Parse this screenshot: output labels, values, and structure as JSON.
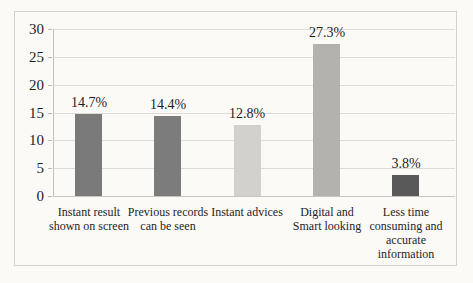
{
  "chart_data": {
    "type": "bar",
    "title": "",
    "xlabel": "",
    "ylabel": "",
    "categories": [
      "Instant result shown on screen",
      "Previous records can be seen",
      "Instant advices",
      "Digital and Smart looking",
      "Less time consuming and accurate information"
    ],
    "category_display": [
      "Instant result\nshown on screen",
      "Previous records\ncan be seen",
      "Instant advices",
      "Digital and\nSmart looking",
      "Less time\nconsuming and\naccurate\ninformation"
    ],
    "values": [
      14.7,
      14.4,
      12.8,
      27.3,
      3.8
    ],
    "data_labels": [
      "14.7%",
      "14.4%",
      "12.8%",
      "27.3%",
      "3.8%"
    ],
    "bar_colors": [
      "#7a7a7a",
      "#7c7c7c",
      "#d2d1ce",
      "#b3b2af",
      "#595959"
    ],
    "ylim": [
      0,
      30
    ],
    "yticks": [
      0,
      5,
      10,
      15,
      20,
      25,
      30
    ],
    "grid": true,
    "legend_position": "none"
  },
  "style": {
    "page_background": "#fbfaf7",
    "frame_border_color": "#d5d2cb",
    "gridline_color": "#dedbd5",
    "axis_line_color": "#c6c3bd",
    "text_color": "#1e1e1e"
  }
}
